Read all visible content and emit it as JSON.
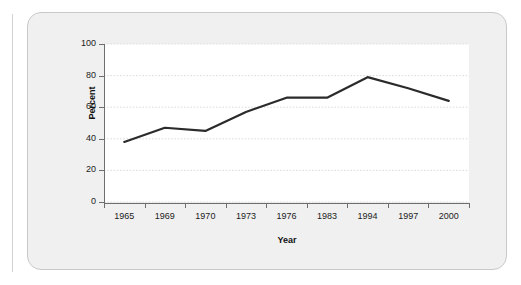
{
  "card": {
    "background_color": "#f0f0f0",
    "border_color": "#c9c9c9"
  },
  "chart_data": {
    "type": "line",
    "title": "",
    "subtitle": "",
    "xlabel": "Year",
    "ylabel": "Percent",
    "categories": [
      "1965",
      "1969",
      "1970",
      "1973",
      "1976",
      "1983",
      "1994",
      "1997",
      "2000"
    ],
    "values": [
      38,
      47,
      45,
      57,
      66,
      66,
      79,
      72,
      64
    ],
    "series": [
      {
        "name": "Percent",
        "values": [
          38,
          47,
          45,
          57,
          66,
          66,
          79,
          72,
          64
        ],
        "color": "#2b2b2b"
      }
    ],
    "ylim": [
      0,
      100
    ],
    "yticks": [
      0,
      20,
      40,
      60,
      80,
      100
    ],
    "ytick_labels": [
      "0",
      "20",
      "40",
      "60",
      "80",
      "100"
    ],
    "grid": true,
    "grid_axis": "y",
    "grid_style": "dotted",
    "grid_color": "#dcdcdc",
    "legend": false,
    "legend_position": "none",
    "line_color": "#2b2b2b",
    "line_width": 2.2,
    "markers": false,
    "plot_background": "#ffffff",
    "annotations": []
  }
}
